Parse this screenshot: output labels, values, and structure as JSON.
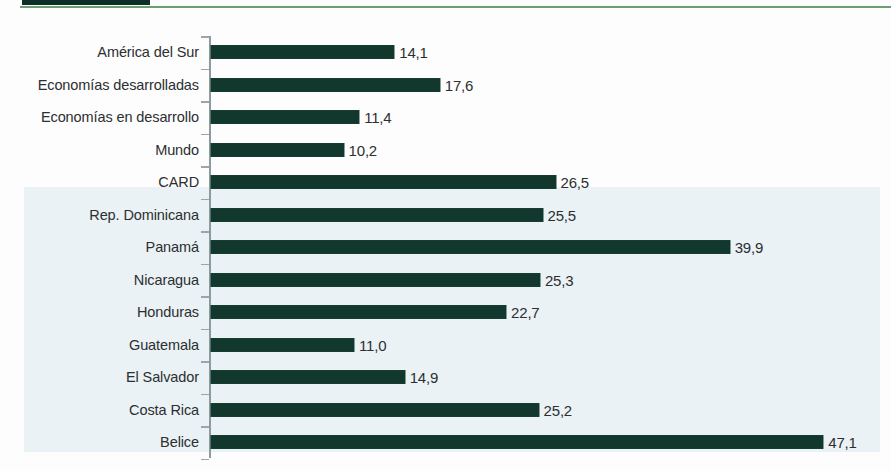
{
  "header": {
    "tab_block_color": "#0d2f26",
    "rule_color": "#6e9d72",
    "fragment_text": ""
  },
  "chart_style": {
    "bar_color": "#12382e",
    "highlight_band_color": "#eaf2f5",
    "axis_color": "#8d9ba0",
    "label_color": "#2c2f31",
    "page_background": "#fdfdfd"
  },
  "chart_data": {
    "type": "bar",
    "orientation": "horizontal",
    "title": "",
    "subtitle": "",
    "xlabel": "",
    "ylabel": "",
    "grid": false,
    "legend": false,
    "xlim": [
      0,
      52
    ],
    "value_format": "comma-decimal",
    "decimal_separator": ",",
    "pixels_per_unit": 13.0,
    "highlighted_categories": [
      "Rep. Dominicana",
      "Panamá",
      "Nicaragua",
      "Honduras",
      "Guatemala",
      "El Salvador",
      "Costa Rica",
      "Belice"
    ],
    "categories": [
      "América del Sur",
      "Economías desarrolladas",
      "Economías en desarrollo",
      "Mundo",
      "CARD",
      "Rep. Dominicana",
      "Panamá",
      "Nicaragua",
      "Honduras",
      "Guatemala",
      "El Salvador",
      "Costa Rica",
      "Belice"
    ],
    "values": [
      14.1,
      17.6,
      11.4,
      10.2,
      26.5,
      25.5,
      39.9,
      25.3,
      22.7,
      11.0,
      14.9,
      25.2,
      47.1
    ],
    "value_labels": [
      "14,1",
      "17,6",
      "11,4",
      "10,2",
      "26,5",
      "25,5",
      "39,9",
      "25,3",
      "22,7",
      "11,0",
      "14,9",
      "25,2",
      "47,1"
    ]
  }
}
